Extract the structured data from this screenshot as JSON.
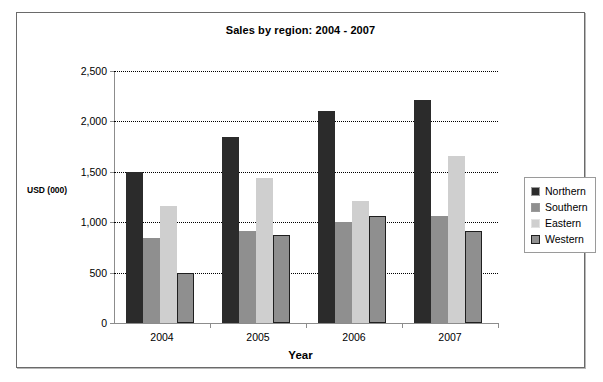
{
  "chart_data": {
    "type": "bar",
    "title": "Sales by region: 2004 - 2007",
    "xlabel": "Year",
    "ylabel": "USD (000)",
    "categories": [
      "2004",
      "2005",
      "2006",
      "2007"
    ],
    "series": [
      {
        "name": "Northern",
        "color": "#2b2b2b",
        "values": [
          1500,
          1850,
          2100,
          2210
        ]
      },
      {
        "name": "Southern",
        "color": "#8f8f8f",
        "values": [
          840,
          910,
          1000,
          1060
        ]
      },
      {
        "name": "Eastern",
        "color": "#cfcfcf",
        "values": [
          1160,
          1440,
          1210,
          1660
        ]
      },
      {
        "name": "Western",
        "color": "#8f8f8f",
        "values": [
          500,
          870,
          1060,
          910
        ]
      }
    ],
    "ylim": [
      0,
      2500
    ],
    "ytick_values": [
      0,
      500,
      1000,
      1500,
      2000,
      2500
    ],
    "ytick_labels": [
      "0",
      "500",
      "1,000",
      "1,500",
      "2,000",
      "2,500"
    ],
    "grid": true,
    "grid_style": "dotted",
    "legend_position": "right",
    "legend_entries": [
      "Northern",
      "Southern",
      "Eastern",
      "Western"
    ]
  }
}
